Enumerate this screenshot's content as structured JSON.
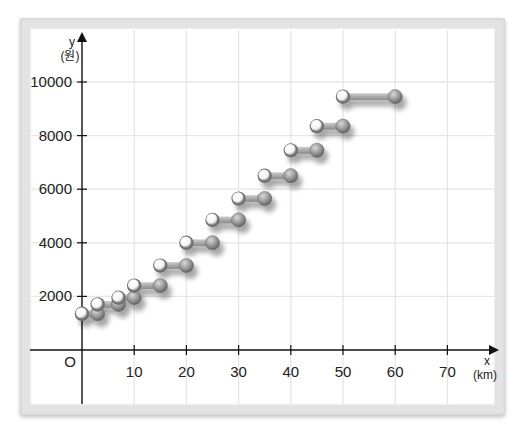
{
  "chart_data": {
    "type": "scatter",
    "subtype": "step-function",
    "title": "",
    "xlabel": "x",
    "xunit": "(km)",
    "ylabel": "y",
    "yunit": "(원)",
    "origin_label": "O",
    "xlim": [
      -10,
      75
    ],
    "ylim": [
      -1000,
      10500
    ],
    "x_ticks": [
      10,
      20,
      30,
      40,
      50,
      60,
      70
    ],
    "y_ticks": [
      2000,
      4000,
      6000,
      8000,
      10000
    ],
    "grid": true,
    "legend": null,
    "note": "Open (white) circle marks excluded left endpoint; filled (gray) circle marks included right endpoint of each step.",
    "steps": [
      {
        "x_open": 0,
        "x_closed": 3,
        "y": 1350
      },
      {
        "x_open": 3,
        "x_closed": 7,
        "y": 1700
      },
      {
        "x_open": 7,
        "x_closed": 10,
        "y": 1950
      },
      {
        "x_open": 10,
        "x_closed": 15,
        "y": 2400
      },
      {
        "x_open": 15,
        "x_closed": 20,
        "y": 3150
      },
      {
        "x_open": 20,
        "x_closed": 25,
        "y": 4000
      },
      {
        "x_open": 25,
        "x_closed": 30,
        "y": 4850
      },
      {
        "x_open": 30,
        "x_closed": 35,
        "y": 5650
      },
      {
        "x_open": 35,
        "x_closed": 40,
        "y": 6500
      },
      {
        "x_open": 40,
        "x_closed": 45,
        "y": 7450
      },
      {
        "x_open": 45,
        "x_closed": 50,
        "y": 8350
      },
      {
        "x_open": 50,
        "x_closed": 60,
        "y": 9450
      }
    ]
  },
  "colors": {
    "frame": "#e3e3e3",
    "grid": "#e6e6e6",
    "axis": "#111111",
    "open_point": "#ffffff",
    "closed_point": "#8f8f8f",
    "bar": "#a8a8a8"
  }
}
